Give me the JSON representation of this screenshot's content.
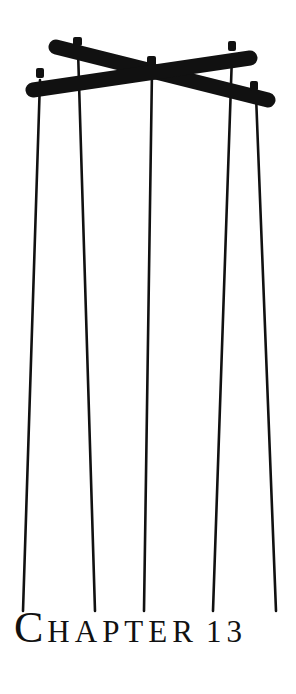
{
  "heading": {
    "first_letter": "C",
    "rest": "HAPTER",
    "number": "13"
  },
  "illustration": {
    "subject": "marionette control bar with strings",
    "ink_color": "#111111"
  }
}
